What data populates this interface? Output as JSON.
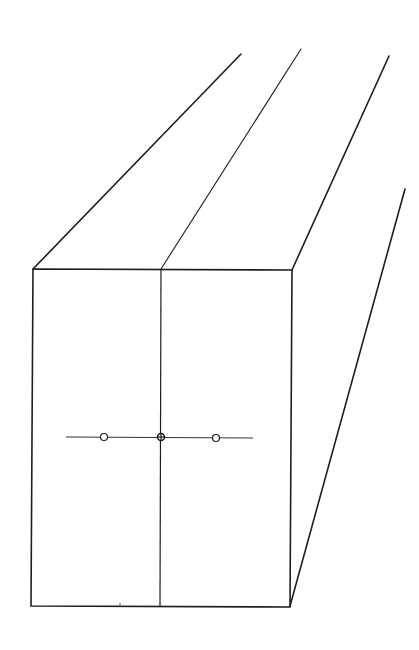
{
  "diagram": {
    "colors": {
      "background": "#ffffff",
      "stroke": "#1e1e1e",
      "stroke_light": "#333333"
    },
    "front_face": {
      "top_left": [
        33,
        269
      ],
      "top_right": [
        292,
        270
      ],
      "bottom_right": [
        290,
        607
      ],
      "bottom_left": [
        31,
        606
      ]
    },
    "center_divider": {
      "x1": 161,
      "y1": 269,
      "x2": 160,
      "y2": 606
    },
    "receding_edges": [
      {
        "name": "top-left-edge",
        "x1": 33,
        "y1": 269,
        "x2": 241,
        "y2": 54
      },
      {
        "name": "top-center-edge",
        "x1": 161,
        "y1": 269,
        "x2": 301,
        "y2": 49
      },
      {
        "name": "top-right-edge",
        "x1": 292,
        "y1": 270,
        "x2": 389,
        "y2": 56
      },
      {
        "name": "bottom-right-edge",
        "x1": 290,
        "y1": 606,
        "x2": 405,
        "y2": 189
      }
    ],
    "horizontal_axis": {
      "x1": 66,
      "y1": 437,
      "x2": 253,
      "y2": 438
    },
    "points": [
      {
        "name": "left-point",
        "cx": 104,
        "cy": 437,
        "r": 3.5,
        "filled": false
      },
      {
        "name": "center-point",
        "cx": 161,
        "cy": 437,
        "r": 3.5,
        "filled": false,
        "crosshair": true
      },
      {
        "name": "right-point",
        "cx": 216,
        "cy": 438,
        "r": 3.5,
        "filled": false
      }
    ],
    "tick_mark": {
      "x": 120,
      "y1": 603,
      "y2": 606
    }
  }
}
